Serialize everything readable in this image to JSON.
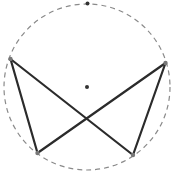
{
  "diagram": {
    "type": "geometry",
    "circle": {
      "cx": 87,
      "cy": 87,
      "r": 83,
      "stroke": "#8a8a8a",
      "dash": "5,4"
    },
    "center_point": {
      "x": 87,
      "y": 87,
      "r": 2,
      "fill": "#333333"
    },
    "top_point": {
      "x": 87.5,
      "y": 3.5,
      "r": 2,
      "fill": "#333333"
    },
    "vertices": [
      {
        "id": "left",
        "x": 10.5,
        "y": 59
      },
      {
        "id": "right",
        "x": 165.5,
        "y": 63
      },
      {
        "id": "bottom-left",
        "x": 37.5,
        "y": 153
      },
      {
        "id": "bottom-right",
        "x": 133,
        "y": 155
      }
    ],
    "vertex_style": {
      "r": 2.2,
      "fill": "#777777"
    },
    "edges": [
      {
        "from": "left",
        "to": "bottom-left"
      },
      {
        "from": "left",
        "to": "bottom-right"
      },
      {
        "from": "right",
        "to": "bottom-right"
      },
      {
        "from": "right",
        "to": "bottom-left"
      }
    ],
    "edge_style": {
      "stroke": "#2b2b2b",
      "width": 2.2
    }
  }
}
